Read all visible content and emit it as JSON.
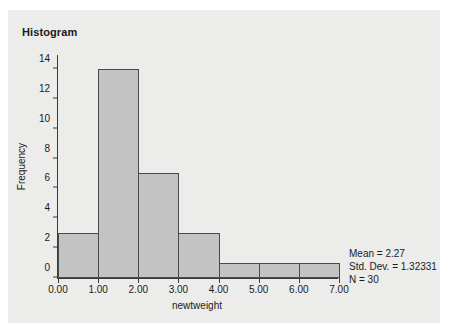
{
  "chart_data": {
    "type": "bar",
    "title": "Histogram",
    "xlabel": "newtweight",
    "ylabel": "Frequency",
    "categories": [
      "0.00-1.00",
      "1.00-2.00",
      "2.00-3.00",
      "3.00-4.00",
      "4.00-5.00",
      "5.00-6.00",
      "6.00-7.00"
    ],
    "bin_edges": [
      0,
      1,
      2,
      3,
      4,
      5,
      6,
      7
    ],
    "values": [
      3,
      14,
      7,
      3,
      1,
      1,
      1
    ],
    "xlim": [
      0,
      7
    ],
    "ylim": [
      0,
      15
    ],
    "x_ticks": [
      0,
      1,
      2,
      3,
      4,
      5,
      6,
      7
    ],
    "x_tick_labels": [
      "0.00",
      "1.00",
      "2.00",
      "3.00",
      "4.00",
      "5.00",
      "6.00",
      "7.00"
    ],
    "y_ticks": [
      0,
      2,
      4,
      6,
      8,
      10,
      12,
      14
    ],
    "y_tick_labels": [
      "0",
      "2",
      "4",
      "6",
      "8",
      "10",
      "12",
      "14"
    ],
    "grid": false,
    "legend": false,
    "annotations": [
      "Mean = 2.27",
      "Std. Dev. = 1.32331",
      "N = 30"
    ],
    "bar_fill_color": "#c3c3c3",
    "bar_border_color": "#4a4a4a",
    "panel_background_color": "#ececeb",
    "axis_color": "#3a3a3a",
    "text_color": "#1a1a1a"
  },
  "stats": {
    "mean_label": "Mean = 2.27",
    "std_dev_label": "Std. Dev. = 1.32331",
    "n_label": "N = 30"
  }
}
